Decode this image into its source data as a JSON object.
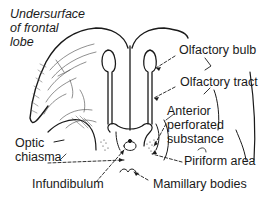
{
  "diagram": {
    "title": "Undersurface of frontal lobe",
    "title_lines": [
      "Undersurface",
      "of frontal",
      "lobe"
    ],
    "labels": {
      "olfactory_bulb": "Olfactory bulb",
      "olfactory_tract": "Olfactory tract",
      "anterior_perforated_substance_lines": [
        "Anterior",
        "perforated",
        "substance"
      ],
      "optic_chiasma_lines": [
        "Optic",
        "chiasma"
      ],
      "piriform_area": "Piriform area",
      "infundibulum": "Infundibulum",
      "mamillary_bodies": "Mamillary bodies"
    },
    "colors": {
      "ink": "#1a1a1a",
      "background": "#ffffff"
    }
  }
}
